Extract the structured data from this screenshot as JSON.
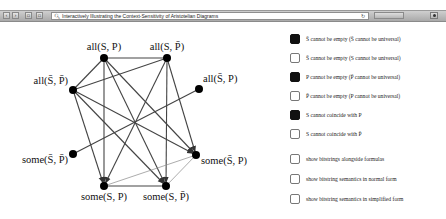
{
  "browser": {
    "nav_buttons": [
      "back",
      "forward",
      "share",
      "sidebar"
    ],
    "address": "Interactively Illustrating the Context-Sensitivity of Aristotelian Diagrams",
    "search_icon": "search-icon",
    "reload_icon": "reload-icon"
  },
  "diagram": {
    "nodes": [
      {
        "id": "allSP",
        "label": "all(S, P)",
        "x": 104,
        "y": 36
      },
      {
        "id": "allSPbar",
        "label": "all(S, P̄)",
        "x": 167,
        "y": 36
      },
      {
        "id": "allSbarPbar",
        "label": "all(S̄, P̄)",
        "x": 73,
        "y": 68
      },
      {
        "id": "allSbarP",
        "label": "all(S̄, P)",
        "x": 199,
        "y": 67
      },
      {
        "id": "someSbarPbar",
        "label": "some(S̄, P̄)",
        "x": 73,
        "y": 132
      },
      {
        "id": "someSbarP",
        "label": "some(S̄, P)",
        "x": 196,
        "y": 133
      },
      {
        "id": "someSP",
        "label": "some(S, P)",
        "x": 104,
        "y": 164
      },
      {
        "id": "someSPbar",
        "label": "some(S, P̄)",
        "x": 166,
        "y": 164
      }
    ]
  },
  "options": [
    {
      "label": "S̄ cannot be empty (S̄ cannot be universal)",
      "checked": true
    },
    {
      "label": "S̄ cannot be empty (S cannot be universal)",
      "checked": false
    },
    {
      "label": "P cannot be empty (P̄ cannot be universal)",
      "checked": true
    },
    {
      "label": "P̄ cannot be empty (P cannot be universal)",
      "checked": false
    },
    {
      "label": "S cannot coincide with P",
      "checked": true
    },
    {
      "label": "S cannot coincide with P̄",
      "checked": false
    },
    {
      "label": "show bitstrings alongside formulas",
      "checked": false
    },
    {
      "label": "show bitstring semantics in normal form",
      "checked": false
    },
    {
      "label": "show bitstring semantics in simplified form",
      "checked": false
    }
  ],
  "colors": {
    "edge": "#444444",
    "thin_edge": "#777777",
    "node": "#000000",
    "checked": "#111111"
  }
}
